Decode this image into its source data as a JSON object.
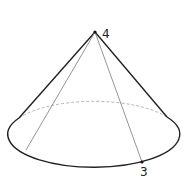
{
  "diagram": {
    "type": "cone",
    "apex": {
      "x": 95,
      "y": 32,
      "label": "4"
    },
    "base_ellipse": {
      "cx": 96,
      "cy": 133,
      "rx": 86,
      "ry": 33
    },
    "base_point": {
      "x": 142,
      "y": 162,
      "label": "3"
    },
    "second_generatrix_end": {
      "x": 26,
      "y": 150
    },
    "colors": {
      "outline": "#222222",
      "hidden_edge": "#999999",
      "generatrix": "#888888",
      "background": "#ffffff"
    }
  },
  "labels": {
    "apex_label": "4",
    "base_point_label": "3"
  }
}
